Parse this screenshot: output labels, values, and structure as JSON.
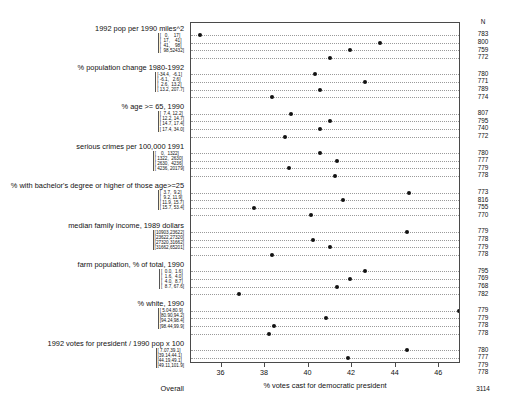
{
  "chart_data": {
    "type": "scatter",
    "title": "",
    "xlabel": "% votes cast for democratic president",
    "ylabel": "",
    "xlim": [
      34.6,
      47.0
    ],
    "xticks": [
      36,
      38,
      40,
      42,
      44,
      46
    ],
    "xticklabels": [
      "36",
      "38",
      "40",
      "42",
      "44",
      "46"
    ],
    "grid": "horizontal-dotted-per-row",
    "legend": "none",
    "n_column_header": "N",
    "groups": [
      {
        "name": "1992 pop per 1990 miles^2",
        "rows": [
          {
            "bracket": "[   0,    17]",
            "value": 35.0,
            "n": "783"
          },
          {
            "bracket": "[  17,    41]",
            "value": 43.3,
            "n": "800"
          },
          {
            "bracket": "[  41,    98]",
            "value": 41.9,
            "n": "759"
          },
          {
            "bracket": "[  98,52432]",
            "value": 41.0,
            "n": "772"
          }
        ]
      },
      {
        "name": "% population change 1980-1992",
        "rows": [
          {
            "bracket": "[-34.4,  -6.1]",
            "value": 40.3,
            "n": "780"
          },
          {
            "bracket": "[ -6.1,   2.6]",
            "value": 42.6,
            "n": "771"
          },
          {
            "bracket": "[  2.6,  13.2]",
            "value": 40.5,
            "n": "789"
          },
          {
            "bracket": "[ 13.2, 207.7]",
            "value": 38.3,
            "n": "774"
          }
        ]
      },
      {
        "name": "% age >= 65, 1990",
        "rows": [
          {
            "bracket": "[  7.4, 12.2]",
            "value": 39.2,
            "n": "807"
          },
          {
            "bracket": "[ 12.2, 14.7]",
            "value": 41.0,
            "n": "795"
          },
          {
            "bracket": "[ 14.7, 17.4]",
            "value": 40.5,
            "n": "740"
          },
          {
            "bracket": "[ 17.4, 34.0]",
            "value": 38.9,
            "n": "772"
          }
        ]
      },
      {
        "name": "serious crimes per 100,000 1991",
        "rows": [
          {
            "bracket": "[    0,  1322]",
            "value": 40.5,
            "n": "780"
          },
          {
            "bracket": "[ 1322,  2630]",
            "value": 41.3,
            "n": "777"
          },
          {
            "bracket": "[ 2630,  4236]",
            "value": 39.1,
            "n": "779"
          },
          {
            "bracket": "[ 4236, 20179]",
            "value": 41.2,
            "n": "778"
          }
        ]
      },
      {
        "name": "% with bachelor's degree or higher of those age>=25",
        "rows": [
          {
            "bracket": "[  3.7,  9.2]",
            "value": 44.6,
            "n": "773"
          },
          {
            "bracket": "[  9.2, 11.9]",
            "value": 41.6,
            "n": "816"
          },
          {
            "bracket": "[ 11.9, 15.7]",
            "value": 37.5,
            "n": "755"
          },
          {
            "bracket": "[ 15.7, 53.4]",
            "value": 40.1,
            "n": "770"
          }
        ]
      },
      {
        "name": "median family income, 1989 dollars",
        "rows": [
          {
            "bracket": "[10903,23622]",
            "value": 44.5,
            "n": "779"
          },
          {
            "bracket": "[23622,27320]",
            "value": 40.2,
            "n": "778"
          },
          {
            "bracket": "[27320,31662]",
            "value": 41.0,
            "n": "779"
          },
          {
            "bracket": "[31662,65201]",
            "value": 38.3,
            "n": "778"
          }
        ]
      },
      {
        "name": "farm population, % of total, 1990",
        "rows": [
          {
            "bracket": "[  0.0,  1.6]",
            "value": 42.6,
            "n": "795"
          },
          {
            "bracket": "[  1.6,  4.0]",
            "value": 41.9,
            "n": "769"
          },
          {
            "bracket": "[  4.0,  8.7]",
            "value": 41.3,
            "n": "768"
          },
          {
            "bracket": "[  8.7, 67.6]",
            "value": 36.8,
            "n": "782"
          }
        ]
      },
      {
        "name": "% white, 1990",
        "rows": [
          {
            "bracket": "[ 5.04,80.9]",
            "value": 46.9,
            "n": "779"
          },
          {
            "bracket": "[80.90,94.2]",
            "value": 40.8,
            "n": "779"
          },
          {
            "bracket": "[94.24,98.4]",
            "value": 38.4,
            "n": "778"
          },
          {
            "bracket": "[98.44,99.9]",
            "value": 38.2,
            "n": "778"
          }
        ]
      },
      {
        "name": "1992 votes for president / 1990 pop x 100",
        "rows": [
          {
            "bracket": "[ 7.07,39.1]",
            "value": 44.5,
            "n": "780"
          },
          {
            "bracket": "[39.14,44.1]",
            "value": 41.8,
            "n": "777"
          },
          {
            "bracket": "[44.19,49.1]",
            "value": 40.0,
            "n": "779"
          },
          {
            "bracket": "[49.11,101.9]",
            "value": 37.8,
            "n": "778"
          }
        ]
      },
      {
        "name": "Overall",
        "plain": true,
        "rows": [
          {
            "bracket": "",
            "value": 40.6,
            "n": "3114"
          }
        ]
      }
    ]
  }
}
